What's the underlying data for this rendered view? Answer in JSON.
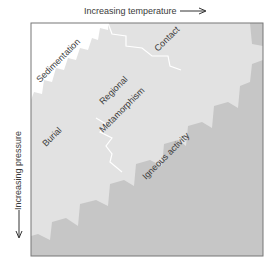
{
  "axes": {
    "x_label": "Increasing temperature",
    "y_label": "Increasing pressure"
  },
  "regions": [
    {
      "name": "Sedimentation",
      "color": "#ffffff"
    },
    {
      "name": "Burial",
      "color": "#e2e2e2"
    },
    {
      "name": "Regional",
      "color": "#e2e2e2"
    },
    {
      "name": "Metamorphism",
      "color": "#e2e2e2"
    },
    {
      "name": "Contact",
      "color": "#e2e2e2"
    },
    {
      "name": "Igneous activity",
      "color": "#c6c6c6"
    }
  ],
  "colors": {
    "frame": "#777777",
    "boundary": "#ffffff",
    "text": "#3a3a3a"
  }
}
